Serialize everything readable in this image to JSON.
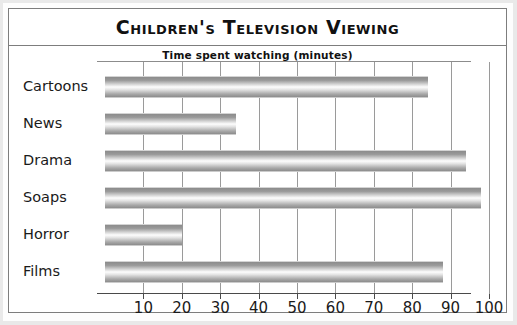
{
  "chart_data": {
    "type": "bar",
    "orientation": "horizontal",
    "title": "Children's Television Viewing",
    "subtitle": "Time spent watching (minutes)",
    "xlabel": "",
    "ylabel": "",
    "categories": [
      "Cartoons",
      "News",
      "Drama",
      "Soaps",
      "Horror",
      "Films"
    ],
    "values": [
      84,
      34,
      94,
      98,
      20,
      88
    ],
    "xlim": [
      0,
      105
    ],
    "xticks": [
      10,
      20,
      30,
      40,
      50,
      60,
      70,
      80,
      90,
      100
    ],
    "xticklabels": [
      "10",
      "20",
      "30",
      "40",
      "50",
      "60",
      "70",
      "80",
      "90",
      "100"
    ],
    "grid": true,
    "legend": false,
    "bar_fill": "#b0b0b0",
    "axis_color": "#4a4a4a",
    "grid_color": "#9a9a9a",
    "text_color": "#1a1a1a",
    "frame_color": "#7d7d7d"
  }
}
